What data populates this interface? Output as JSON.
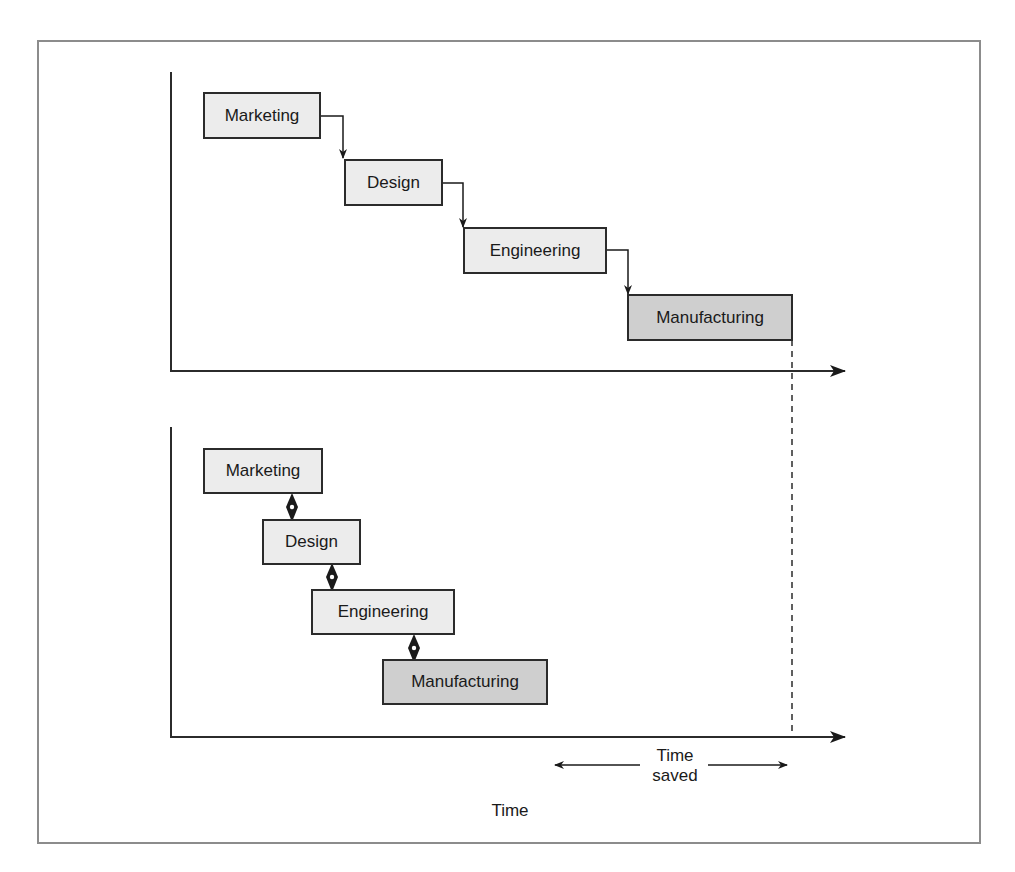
{
  "diagram": {
    "title": "",
    "sequential": {
      "label": "Sequential process",
      "stages": [
        {
          "name": "Marketing",
          "style": "light"
        },
        {
          "name": "Design",
          "style": "light"
        },
        {
          "name": "Engineering",
          "style": "light"
        },
        {
          "name": "Manufacturing",
          "style": "dark"
        }
      ],
      "connector": "elbow-arrow"
    },
    "concurrent": {
      "label": "Concurrent process",
      "stages": [
        {
          "name": "Marketing",
          "style": "light"
        },
        {
          "name": "Design",
          "style": "light"
        },
        {
          "name": "Engineering",
          "style": "light"
        },
        {
          "name": "Manufacturing",
          "style": "dark"
        }
      ],
      "connector": "bidirectional-diamond"
    },
    "annotations": {
      "time_saved_line1": "Time",
      "time_saved_line2": "saved",
      "axis_label": "Time"
    },
    "colors": {
      "light_box": "#ececec",
      "dark_box": "#cfcfcf",
      "stroke": "#2b2b2b",
      "frame": "#8c8c8c"
    }
  }
}
